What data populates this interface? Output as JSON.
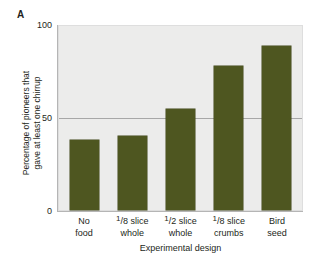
{
  "figure": {
    "panel_label": "A"
  },
  "chart_data": {
    "type": "bar",
    "title": "",
    "xlabel": "Experimental design",
    "ylabel": "Percentage of pioneers that gave at least one chirrup",
    "ylabel_line1": "Percentage of pioneers that",
    "ylabel_line2": "gave at least one chirrup",
    "categories": [
      "No food",
      "1/8 slice whole",
      "1/2 slice whole",
      "1/8 slice crumbs",
      "Bird seed"
    ],
    "category_lines": [
      {
        "numerator": "",
        "denominator": "",
        "word": "No",
        "line2": "food"
      },
      {
        "numerator": "1",
        "denominator": "8",
        "word": "slice",
        "line2": "whole"
      },
      {
        "numerator": "1",
        "denominator": "2",
        "word": "slice",
        "line2": "whole"
      },
      {
        "numerator": "1",
        "denominator": "8",
        "word": "slice",
        "line2": "crumbs"
      },
      {
        "numerator": "",
        "denominator": "",
        "word": "Bird",
        "line2": "seed"
      }
    ],
    "values": [
      38,
      40,
      55,
      78,
      89
    ],
    "ylim": [
      0,
      100
    ],
    "yticks": [
      0,
      50,
      100
    ],
    "ytick_labels": [
      "0",
      "50",
      "100"
    ],
    "grid": true,
    "gridlines_at": [
      50
    ],
    "legend": "none",
    "bar_color": "#4e5620",
    "plot_background": "#ececeb",
    "axis_color": "#b5b5b5",
    "gridline_color": "#a7a7a7"
  }
}
